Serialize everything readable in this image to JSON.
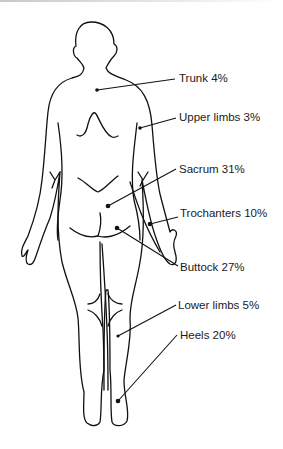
{
  "diagram": {
    "type": "anatomical-body-outline",
    "view": "posterior",
    "labels": [
      {
        "id": "trunk",
        "name": "Trunk",
        "value": "4%",
        "text": "Trunk 4%"
      },
      {
        "id": "upper_limbs",
        "name": "Upper limbs",
        "value": "3%",
        "text": "Upper limbs 3%"
      },
      {
        "id": "sacrum",
        "name": "Sacrum",
        "value": "31%",
        "text": "Sacrum 31%"
      },
      {
        "id": "trochanters",
        "name": "Trochanters",
        "value": "10%",
        "text": "Trochanters 10%"
      },
      {
        "id": "buttock",
        "name": "Buttock",
        "value": "27%",
        "text": "Buttock 27%"
      },
      {
        "id": "lower_limbs",
        "name": "Lower limbs",
        "value": "5%",
        "text": "Lower limbs 5%"
      },
      {
        "id": "heels",
        "name": "Heels",
        "value": "20%",
        "text": "Heels 20%"
      }
    ],
    "colors": {
      "line": "#111111",
      "text": "#1a1a1a",
      "background": "#ffffff"
    }
  }
}
